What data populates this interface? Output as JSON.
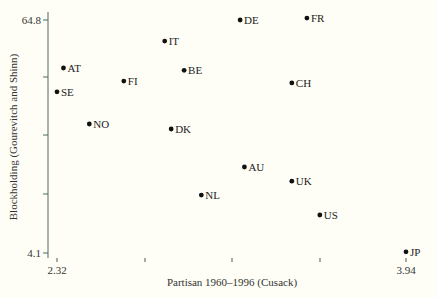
{
  "chart_data": {
    "type": "scatter",
    "title": "",
    "xlabel": "Partisan 1960–1996 (Cusack)",
    "ylabel": "Blockholding (Gourevitch and Shinn)",
    "xlim": [
      2.32,
      3.94
    ],
    "ylim": [
      4.1,
      64.8
    ],
    "x_tick_labels": [
      "2.32",
      "3.94"
    ],
    "y_tick_labels": [
      "64.8",
      "4.1"
    ],
    "grid": false,
    "legend": null,
    "points": [
      {
        "label": "DE",
        "x": 3.17,
        "y": 64.8
      },
      {
        "label": "FR",
        "x": 3.48,
        "y": 65.3
      },
      {
        "label": "IT",
        "x": 2.82,
        "y": 59.3
      },
      {
        "label": "AT",
        "x": 2.35,
        "y": 52.3
      },
      {
        "label": "BE",
        "x": 2.91,
        "y": 51.7
      },
      {
        "label": "FI",
        "x": 2.63,
        "y": 48.9
      },
      {
        "label": "CH",
        "x": 3.41,
        "y": 48.4
      },
      {
        "label": "SE",
        "x": 2.32,
        "y": 46.1
      },
      {
        "label": "NO",
        "x": 2.47,
        "y": 37.7
      },
      {
        "label": "DK",
        "x": 2.85,
        "y": 36.4
      },
      {
        "label": "AU",
        "x": 3.19,
        "y": 26.5
      },
      {
        "label": "UK",
        "x": 3.41,
        "y": 22.8
      },
      {
        "label": "NL",
        "x": 2.99,
        "y": 19.2
      },
      {
        "label": "US",
        "x": 3.54,
        "y": 14.0
      },
      {
        "label": "JP",
        "x": 3.94,
        "y": 4.4
      }
    ]
  },
  "plot": {
    "px_left": 57,
    "px_right": 406,
    "px_top": 20,
    "px_bottom": 253,
    "axis_x_line": 258,
    "axis_y_line": 48,
    "x_ticks_px": [
      57,
      145,
      232,
      320,
      406
    ],
    "y_ticks_px": [
      20,
      77,
      135,
      194,
      253
    ]
  }
}
